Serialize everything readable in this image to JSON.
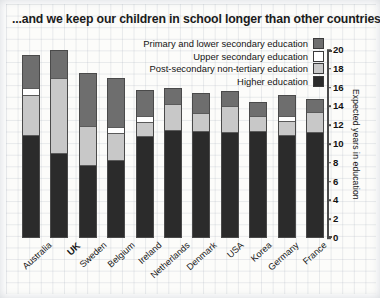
{
  "title": "...and we keep our children in school longer than other countries",
  "legend": {
    "items": [
      {
        "label": "Primary and lower secondary education",
        "color": "#6e6e6e",
        "key": "primary"
      },
      {
        "label": "Upper secondary education",
        "color": "#ffffff",
        "key": "upper"
      },
      {
        "label": "Post-secondary non-tertiary education",
        "color": "#c8c8c8",
        "key": "post"
      },
      {
        "label": "Higher education",
        "color": "#2b2b2b",
        "key": "higher"
      }
    ]
  },
  "axis": {
    "ylabel": "Expected years in education",
    "ticks": [
      "20",
      "18",
      "16",
      "14",
      "12",
      "10",
      "8",
      "6",
      "4",
      "2",
      "0"
    ]
  },
  "chart_data": {
    "type": "bar",
    "title": "...and we keep our children in school longer than other countries",
    "xlabel": "",
    "ylabel": "Expected years in education",
    "ylim": [
      0,
      20
    ],
    "stacked": true,
    "grid": false,
    "legend_position": "top-right",
    "highlight": "UK",
    "categories": [
      "Australia",
      "UK",
      "Sweden",
      "Belgium",
      "Ireland",
      "Netherlands",
      "Denmark",
      "USA",
      "Korea",
      "Germany",
      "France"
    ],
    "series": [
      {
        "name": "Higher education",
        "color": "#2b2b2b",
        "values": [
          11.0,
          9.0,
          7.8,
          8.3,
          10.9,
          11.5,
          11.4,
          11.3,
          11.4,
          11.0,
          11.3
        ]
      },
      {
        "name": "Post-secondary non-tertiary education",
        "color": "#c8c8c8",
        "values": [
          4.3,
          8.1,
          4.2,
          2.9,
          1.5,
          2.8,
          2.0,
          2.8,
          1.7,
          1.5,
          2.2
        ]
      },
      {
        "name": "Upper secondary education",
        "color": "#ffffff",
        "values": [
          0.7,
          0.0,
          0.0,
          0.7,
          0.7,
          0.0,
          0.0,
          0.0,
          0.0,
          0.6,
          0.0
        ]
      },
      {
        "name": "Primary and lower secondary education",
        "color": "#6e6e6e",
        "values": [
          3.5,
          2.9,
          5.6,
          5.1,
          2.6,
          1.7,
          2.0,
          1.5,
          1.4,
          2.1,
          1.3
        ]
      }
    ],
    "totals": [
      19.5,
      20.0,
      17.6,
      17.0,
      15.7,
      16.0,
      15.4,
      15.6,
      14.5,
      15.2,
      14.8
    ]
  }
}
